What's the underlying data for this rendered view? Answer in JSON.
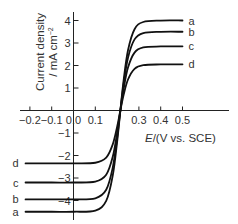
{
  "chart_data": {
    "type": "line",
    "title": "",
    "xlabel": "E/(V vs. SCE)",
    "xlabel_italic_part": "E",
    "xlabel_rest": "/(V vs. SCE)",
    "ylabel": "Current density / mA cm^-2",
    "ylabel_line1": "Current density",
    "ylabel_line2": "/ mA cm",
    "ylabel_sup": "−2",
    "xlim": [
      -0.24,
      0.7
    ],
    "ylim": [
      -5,
      4.4
    ],
    "grid": false,
    "legend": "inline labels at curve ends",
    "x_ticks": [
      {
        "value": -0.2,
        "label": "−0.2"
      },
      {
        "value": -0.1,
        "label": "−0.1"
      },
      {
        "value": 0.0,
        "label": "0.0"
      },
      {
        "value": 0.1,
        "label": "0.1"
      },
      {
        "value": 0.3,
        "label": "0.3"
      },
      {
        "value": 0.4,
        "label": "0.4"
      },
      {
        "value": 0.5,
        "label": "0.5"
      }
    ],
    "y_ticks": [
      {
        "value": 4,
        "label": "4"
      },
      {
        "value": 3,
        "label": "3"
      },
      {
        "value": 2,
        "label": "2"
      },
      {
        "value": 1,
        "label": "1"
      },
      {
        "value": -1,
        "label": "−1"
      },
      {
        "value": -2,
        "label": "−2"
      },
      {
        "value": -3,
        "label": "−3"
      },
      {
        "value": -4,
        "label": "−4"
      }
    ],
    "x": [
      -0.22,
      -0.1,
      0.0,
      0.1,
      0.15,
      0.18,
      0.2,
      0.215,
      0.23,
      0.25,
      0.28,
      0.32,
      0.4,
      0.5
    ],
    "series": [
      {
        "name": "a",
        "values": [
          -4.5,
          -4.5,
          -4.5,
          -4.446,
          -4.016,
          -2.894,
          -1.404,
          0,
          1.352,
          2.678,
          3.613,
          3.933,
          3.998,
          4.0
        ]
      },
      {
        "name": "b",
        "values": [
          -3.95,
          -3.95,
          -3.95,
          -3.903,
          -3.524,
          -2.539,
          -1.232,
          0,
          1.184,
          2.345,
          3.162,
          3.442,
          3.497,
          3.5
        ]
      },
      {
        "name": "c",
        "values": [
          -3.2,
          -3.2,
          -3.2,
          -3.162,
          -2.856,
          -2.059,
          -1.0,
          0,
          0.962,
          1.909,
          2.574,
          2.802,
          2.847,
          2.85
        ]
      },
      {
        "name": "d",
        "values": [
          -2.35,
          -2.35,
          -2.35,
          -2.322,
          -2.095,
          -1.506,
          -0.729,
          0,
          0.697,
          1.377,
          1.853,
          2.016,
          2.048,
          2.05
        ]
      }
    ]
  }
}
